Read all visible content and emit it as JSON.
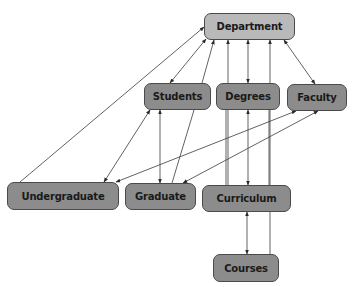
{
  "diagram": {
    "colors": {
      "root_fill": "#b9b9b9",
      "node_fill": "#8c8c8c",
      "border": "#4a4a4a",
      "edge": "#3a3a3a"
    },
    "nodes": [
      {
        "id": "department",
        "label": "Department",
        "x": 204,
        "y": 13,
        "w": 91,
        "h": 27,
        "style": "light"
      },
      {
        "id": "students",
        "label": "Students",
        "x": 144,
        "y": 83,
        "w": 67,
        "h": 27,
        "style": "dark"
      },
      {
        "id": "degrees",
        "label": "Degrees",
        "x": 216,
        "y": 83,
        "w": 64,
        "h": 27,
        "style": "dark"
      },
      {
        "id": "faculty",
        "label": "Faculty",
        "x": 287,
        "y": 84,
        "w": 60,
        "h": 27,
        "style": "dark"
      },
      {
        "id": "undergraduate",
        "label": "Undergraduate",
        "x": 7,
        "y": 182,
        "w": 112,
        "h": 28,
        "style": "dark"
      },
      {
        "id": "graduate",
        "label": "Graduate",
        "x": 125,
        "y": 183,
        "w": 71,
        "h": 27,
        "style": "dark"
      },
      {
        "id": "curriculum",
        "label": "Curriculum",
        "x": 202,
        "y": 185,
        "w": 89,
        "h": 27,
        "style": "dark"
      },
      {
        "id": "courses",
        "label": "Courses",
        "x": 213,
        "y": 254,
        "w": 66,
        "h": 28,
        "style": "dark"
      }
    ],
    "edges": [
      {
        "from": "undergraduate",
        "to": "department",
        "x1": 20,
        "y1": 182,
        "x2": 204,
        "y2": 27,
        "start_arrow": false,
        "end_arrow": true
      },
      {
        "from": "students",
        "to": "department",
        "x1": 170,
        "y1": 83,
        "x2": 206,
        "y2": 39,
        "start_arrow": true,
        "end_arrow": true
      },
      {
        "from": "graduate",
        "to": "department",
        "x1": 202,
        "y1": 83,
        "x2": 214,
        "y2": 40,
        "start_arrow": false,
        "end_arrow": true
      },
      {
        "from": "curriculum",
        "to": "department",
        "x1": 228,
        "y1": 185,
        "x2": 228,
        "y2": 40,
        "start_arrow": false,
        "end_arrow": true
      },
      {
        "from": "degrees",
        "to": "department",
        "x1": 248,
        "y1": 83,
        "x2": 248,
        "y2": 40,
        "start_arrow": true,
        "end_arrow": true
      },
      {
        "from": "courses",
        "to": "department",
        "x1": 270,
        "y1": 254,
        "x2": 270,
        "y2": 40,
        "start_arrow": false,
        "end_arrow": true
      },
      {
        "from": "faculty",
        "to": "department",
        "x1": 315,
        "y1": 84,
        "x2": 284,
        "y2": 40,
        "start_arrow": true,
        "end_arrow": true
      },
      {
        "from": "undergraduate",
        "to": "students",
        "x1": 104,
        "y1": 182,
        "x2": 150,
        "y2": 110,
        "start_arrow": true,
        "end_arrow": true
      },
      {
        "from": "graduate",
        "to": "students",
        "x1": 160,
        "y1": 183,
        "x2": 160,
        "y2": 110,
        "start_arrow": true,
        "end_arrow": true
      },
      {
        "from": "graduate",
        "to": "students_line",
        "x1": 172,
        "y1": 183,
        "x2": 194,
        "y2": 110,
        "start_arrow": false,
        "end_arrow": false
      },
      {
        "from": "undergraduate",
        "to": "faculty",
        "x1": 116,
        "y1": 182,
        "x2": 296,
        "y2": 111,
        "start_arrow": true,
        "end_arrow": true
      },
      {
        "from": "graduate",
        "to": "faculty",
        "x1": 183,
        "y1": 183,
        "x2": 318,
        "y2": 111,
        "start_arrow": true,
        "end_arrow": true
      },
      {
        "from": "curriculum",
        "to": "degrees",
        "x1": 248,
        "y1": 185,
        "x2": 248,
        "y2": 110,
        "start_arrow": true,
        "end_arrow": true
      },
      {
        "from": "curriculum",
        "to": "degrees_line",
        "x1": 226,
        "y1": 185,
        "x2": 226,
        "y2": 110,
        "start_arrow": false,
        "end_arrow": false
      },
      {
        "from": "curriculum",
        "to": "degrees_line2",
        "x1": 269,
        "y1": 185,
        "x2": 269,
        "y2": 110,
        "start_arrow": false,
        "end_arrow": false
      },
      {
        "from": "courses",
        "to": "curriculum",
        "x1": 247,
        "y1": 254,
        "x2": 247,
        "y2": 212,
        "start_arrow": true,
        "end_arrow": true
      }
    ]
  }
}
